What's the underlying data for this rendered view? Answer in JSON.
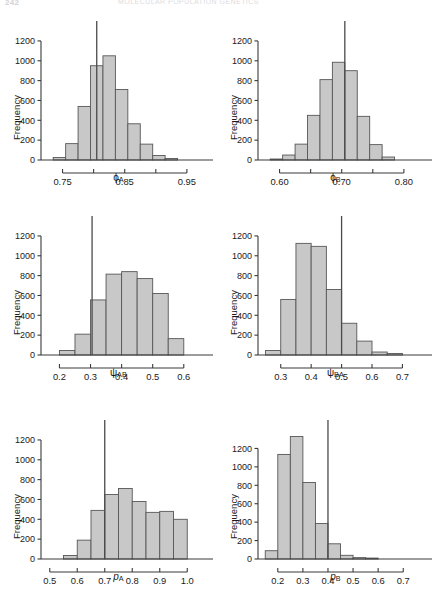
{
  "page": {
    "folio": "242",
    "running_head": "MOLECULAR POPULATION GENETICS"
  },
  "figure": {
    "layout": "2 columns x 3 rows",
    "shared_ylabel": "Frequency",
    "bar_fill": "#c8c8c8",
    "bar_stroke": "#575757",
    "axis_color": "#3a3a3a",
    "refline_color": "#4a4a4a"
  },
  "chart_data": [
    {
      "type": "bar",
      "id": "phi-a",
      "title": "",
      "xlabel": "ϕA",
      "xlabel_base": "ϕ",
      "xlabel_sub": "A",
      "ylabel": "Frequency",
      "ylim": [
        0,
        1300
      ],
      "yticks": [
        0,
        200,
        400,
        600,
        800,
        1000,
        1200
      ],
      "ytick_labels": [
        "0",
        "200",
        "400",
        "600",
        "800",
        "1000",
        "1200"
      ],
      "xlim": [
        0.725,
        0.955
      ],
      "xticks": [
        0.75,
        0.8,
        0.85,
        0.9,
        0.95
      ],
      "xtick_labels": [
        "0.75",
        "",
        "0.85",
        "",
        "0.95"
      ],
      "bin_width": 0.02,
      "bin_starts": [
        0.735,
        0.755,
        0.775,
        0.795,
        0.815,
        0.835,
        0.855,
        0.875,
        0.895,
        0.915
      ],
      "values": [
        25,
        165,
        540,
        950,
        1050,
        710,
        365,
        160,
        45,
        15
      ],
      "reference_line": 0.805,
      "grid": false,
      "legend": "none"
    },
    {
      "type": "bar",
      "id": "phi-b",
      "title": "",
      "xlabel": "ϕB",
      "xlabel_base": "ϕ",
      "xlabel_sub": "B",
      "ylabel": "Frequency",
      "ylim": [
        0,
        1300
      ],
      "yticks": [
        0,
        200,
        400,
        600,
        800,
        1000,
        1200
      ],
      "ytick_labels": [
        "0",
        "200",
        "400",
        "600",
        "800",
        "1000",
        "1200"
      ],
      "xlim": [
        0.575,
        0.805
      ],
      "xticks": [
        0.6,
        0.65,
        0.7,
        0.75,
        0.8
      ],
      "xtick_labels": [
        "0.60",
        "",
        "0.70",
        "",
        "0.80"
      ],
      "bin_width": 0.02,
      "bin_starts": [
        0.585,
        0.605,
        0.625,
        0.645,
        0.665,
        0.685,
        0.705,
        0.725,
        0.745,
        0.765
      ],
      "values": [
        10,
        50,
        160,
        450,
        810,
        985,
        900,
        440,
        155,
        30
      ],
      "reference_line": 0.705,
      "grid": false,
      "legend": "none"
    },
    {
      "type": "bar",
      "id": "psi-ab",
      "title": "",
      "xlabel": "ψAB",
      "xlabel_base": "ψ",
      "xlabel_sub": "AB",
      "ylabel": "Frequency",
      "ylim": [
        0,
        1300
      ],
      "yticks": [
        0,
        200,
        400,
        600,
        800,
        1000,
        1200
      ],
      "ytick_labels": [
        "0",
        "200",
        "400",
        "600",
        "800",
        "1000",
        "1200"
      ],
      "xlim": [
        0.16,
        0.62
      ],
      "xticks": [
        0.2,
        0.3,
        0.4,
        0.5,
        0.6
      ],
      "xtick_labels": [
        "0.2",
        "0.3",
        "0.4",
        "0.5",
        "0.6"
      ],
      "bin_width": 0.05,
      "bin_starts": [
        0.2,
        0.25,
        0.3,
        0.35,
        0.4,
        0.45,
        0.5,
        0.55
      ],
      "values": [
        45,
        210,
        555,
        815,
        840,
        770,
        620,
        165
      ],
      "reference_line": 0.305,
      "grid": false,
      "legend": "none"
    },
    {
      "type": "bar",
      "id": "psi-ba",
      "title": "",
      "xlabel": "ψBA",
      "xlabel_base": "ψ",
      "xlabel_sub": "BA",
      "ylabel": "Frequency",
      "ylim": [
        0,
        1300
      ],
      "yticks": [
        0,
        200,
        400,
        600,
        800,
        1000,
        1200
      ],
      "ytick_labels": [
        "0",
        "200",
        "400",
        "600",
        "800",
        "1000",
        "1200"
      ],
      "xlim": [
        0.245,
        0.715
      ],
      "xticks": [
        0.3,
        0.4,
        0.5,
        0.6,
        0.7
      ],
      "xtick_labels": [
        "0.3",
        "0.4",
        "0.5",
        "0.6",
        "0.7"
      ],
      "bin_width": 0.05,
      "bin_starts": [
        0.25,
        0.3,
        0.35,
        0.4,
        0.45,
        0.5,
        0.55,
        0.6,
        0.65
      ],
      "values": [
        45,
        560,
        1125,
        1095,
        660,
        320,
        140,
        30,
        15
      ],
      "reference_line": 0.5,
      "grid": false,
      "legend": "none"
    },
    {
      "type": "bar",
      "id": "p-a",
      "title": "",
      "xlabel": "pA",
      "xlabel_base": "p",
      "xlabel_sub": "A",
      "ylabel": "Frequency",
      "ylim": [
        0,
        1300
      ],
      "yticks": [
        0,
        200,
        400,
        600,
        800,
        1000,
        1200
      ],
      "ytick_labels": [
        "0",
        "200",
        "400",
        "600",
        "800",
        "1000",
        "1200"
      ],
      "xlim": [
        0.49,
        1.01
      ],
      "xticks": [
        0.5,
        0.6,
        0.7,
        0.8,
        0.9,
        1.0
      ],
      "xtick_labels": [
        "0.5",
        "0.6",
        "0.7",
        "0.8",
        "0.9",
        "1.0"
      ],
      "bin_width": 0.05,
      "bin_starts": [
        0.55,
        0.6,
        0.65,
        0.7,
        0.75,
        0.8,
        0.85,
        0.9,
        0.95
      ],
      "values": [
        35,
        190,
        490,
        650,
        710,
        580,
        470,
        480,
        400
      ],
      "reference_line": 0.7,
      "grid": false,
      "legend": "none"
    },
    {
      "type": "bar",
      "id": "p-b",
      "title": "",
      "xlabel": "pB",
      "xlabel_base": "p",
      "xlabel_sub": "B",
      "ylabel": "Frequency",
      "ylim": [
        0,
        1400
      ],
      "yticks": [
        0,
        200,
        400,
        600,
        800,
        1000,
        1200
      ],
      "ytick_labels": [
        "0",
        "200",
        "400",
        "600",
        "800",
        "1000",
        "1200"
      ],
      "xlim": [
        0.145,
        0.715
      ],
      "xticks": [
        0.2,
        0.3,
        0.4,
        0.5,
        0.6,
        0.7
      ],
      "xtick_labels": [
        "0.2",
        "0.3",
        "0.4",
        "0.5",
        "0.6",
        "0.7"
      ],
      "bin_width": 0.05,
      "bin_starts": [
        0.15,
        0.2,
        0.25,
        0.3,
        0.35,
        0.4,
        0.45,
        0.5,
        0.55
      ],
      "values": [
        90,
        1135,
        1330,
        830,
        385,
        165,
        40,
        15,
        10
      ],
      "reference_line": 0.4,
      "grid": false,
      "legend": "none"
    }
  ]
}
